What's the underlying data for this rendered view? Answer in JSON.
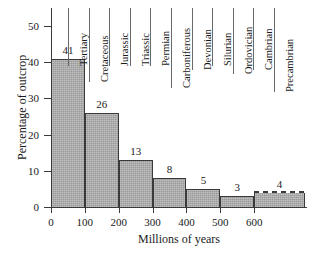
{
  "chart_data": {
    "type": "bar",
    "title": "",
    "xlabel": "Millions of years",
    "ylabel": "Percentage of outcrop",
    "xlim": [
      0,
      750
    ],
    "ylim": [
      0,
      55
    ],
    "grid": false,
    "legend": false,
    "bin_edges": [
      0,
      100,
      200,
      300,
      400,
      500,
      600,
      750
    ],
    "categories": [
      "0-100",
      "100-200",
      "200-300",
      "300-400",
      "400-500",
      "500-600",
      "600+"
    ],
    "values": [
      41,
      26,
      13,
      8,
      5,
      3,
      4
    ],
    "value_labels": [
      "41",
      "26",
      "13",
      "8",
      "5",
      "3",
      "4"
    ],
    "bar_notes": [
      {
        "index": 6,
        "style": "dashed-top",
        "note": "open-ended Precambrian interval"
      }
    ],
    "xticks": [
      0,
      100,
      200,
      300,
      400,
      500,
      600
    ],
    "xtick_labels": [
      "0",
      "100",
      "200",
      "300",
      "400",
      "500",
      "600"
    ],
    "yticks": [
      0,
      10,
      20,
      30,
      40,
      50
    ],
    "ytick_labels": [
      "0",
      "10",
      "20",
      "30",
      "40",
      "50"
    ],
    "periods": [
      "Tertiary",
      "Cretaceous",
      "Jurassic",
      "Triassic",
      "Permian",
      "Carboniferous",
      "Devonian",
      "Silurian",
      "Ordovician",
      "Cambrian",
      "Precambrian"
    ],
    "colors": {
      "bar_fill": "#9a9a9a",
      "bar_edge": "#3a3a3a",
      "axis": "#3a3a3a",
      "text": "#1a1a1a",
      "background": "#ffffff"
    }
  }
}
